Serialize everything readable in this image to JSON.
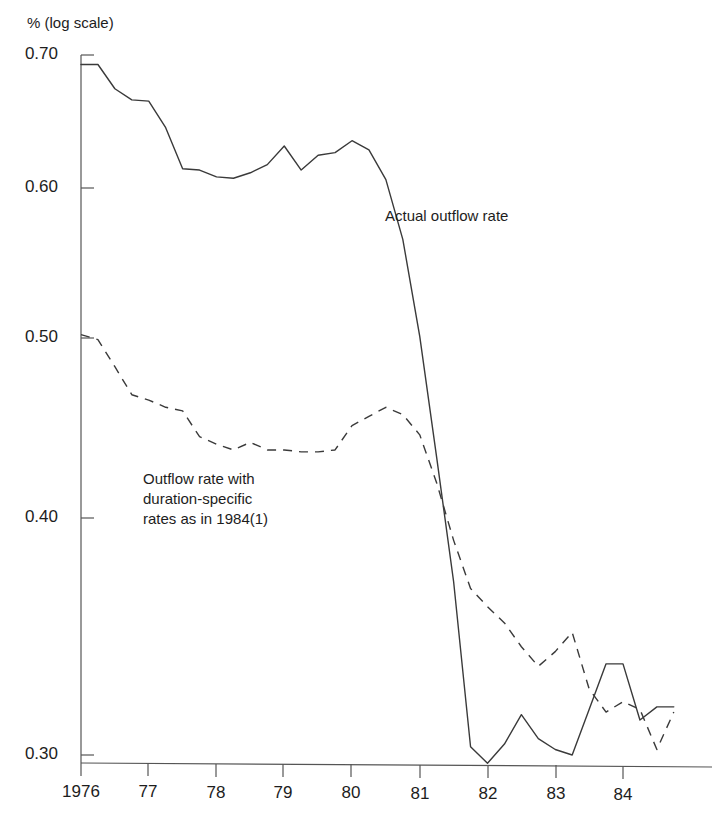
{
  "chart_data": {
    "type": "line",
    "title": "",
    "subtitle": "",
    "xlabel": "",
    "ylabel": "% (log scale)",
    "y_axis_note": "% (log scale)",
    "scale": "log",
    "grid": false,
    "legend_position": "inline-annotations",
    "xlim": [
      1976.0,
      1984.9
    ],
    "ylim": [
      0.285,
      0.705
    ],
    "x_tick_labels": [
      "1976",
      "77",
      "78",
      "79",
      "80",
      "81",
      "82",
      "83",
      "84"
    ],
    "x_tick_values": [
      1976,
      1977,
      1978,
      1979,
      1980,
      1981,
      1982,
      1983,
      1984
    ],
    "y_tick_labels": [
      "0.70",
      "0.60",
      "0.50",
      "0.40",
      "0.30"
    ],
    "y_tick_values": [
      0.7,
      0.6,
      0.5,
      0.4,
      0.3
    ],
    "x": [
      1976.0,
      1976.25,
      1976.5,
      1976.75,
      1977.0,
      1977.25,
      1977.5,
      1977.75,
      1978.0,
      1978.25,
      1978.5,
      1978.75,
      1979.0,
      1979.25,
      1979.5,
      1979.75,
      1980.0,
      1980.25,
      1980.5,
      1980.75,
      1981.0,
      1981.25,
      1981.5,
      1981.75,
      1982.0,
      1982.25,
      1982.5,
      1982.75,
      1983.0,
      1983.25,
      1983.5,
      1983.75,
      1984.0,
      1984.25,
      1984.5,
      1984.75
    ],
    "series": [
      {
        "name": "Actual outflow rate",
        "style": "solid",
        "color": "#3a3a3a",
        "values": [
          0.692,
          0.692,
          0.672,
          0.663,
          0.662,
          0.641,
          0.61,
          0.609,
          0.604,
          0.603,
          0.607,
          0.613,
          0.627,
          0.609,
          0.62,
          0.622,
          0.631,
          0.624,
          0.602,
          0.56,
          0.498,
          0.43,
          0.37,
          0.303,
          0.297,
          0.304,
          0.315,
          0.306,
          0.302,
          0.3,
          0.317,
          0.335,
          0.335,
          0.313,
          0.318,
          0.318
        ],
        "annotation": "Actual outflow rate"
      },
      {
        "name": "Outflow rate with duration-specific rates as in 1984(1)",
        "style": "dashed",
        "color": "#3a3a3a",
        "values": [
          0.499,
          0.496,
          0.48,
          0.464,
          0.461,
          0.457,
          0.455,
          0.441,
          0.437,
          0.434,
          0.438,
          0.434,
          0.434,
          0.433,
          0.433,
          0.434,
          0.447,
          0.452,
          0.457,
          0.453,
          0.442,
          0.417,
          0.389,
          0.367,
          0.359,
          0.352,
          0.342,
          0.334,
          0.34,
          0.348,
          0.325,
          0.316,
          0.32,
          0.317,
          0.302,
          0.316
        ],
        "annotation": "Outflow rate with\nduration-specific\nrates as in 1984(1)"
      }
    ],
    "annotations": [
      {
        "id": "annotation-actual",
        "lines": [
          "Actual outflow rate"
        ],
        "x_px": 385,
        "y_px": 215
      },
      {
        "id": "annotation-counterfactual",
        "lines": [
          "Outflow rate with",
          "duration-specific",
          "rates as in 1984(1)"
        ],
        "x_px": 143,
        "y_px": 470
      }
    ]
  },
  "axis": {
    "unit_label": "% (log scale)",
    "y_labels": [
      "0.70",
      "0.60",
      "0.50",
      "0.40",
      "0.30"
    ],
    "x_labels": [
      "1976",
      "77",
      "78",
      "79",
      "80",
      "81",
      "82",
      "83",
      "84"
    ]
  },
  "annotations": {
    "actual": "Actual outflow rate",
    "counterfactual_line1": "Outflow rate with",
    "counterfactual_line2": "duration-specific",
    "counterfactual_line3": "rates as in 1984(1)"
  }
}
